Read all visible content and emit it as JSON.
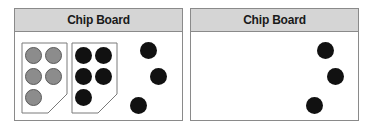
{
  "panels": [
    {
      "title": "Chip Board",
      "holders": [
        {
          "chip_color": "gray",
          "chip_count": 5
        },
        {
          "chip_color": "black",
          "chip_count": 5
        }
      ],
      "loose_chips": {
        "color": "black",
        "count": 3
      }
    },
    {
      "title": "Chip Board",
      "holders": [],
      "loose_chips": {
        "color": "black",
        "count": 3
      }
    }
  ],
  "colors": {
    "header_bg": "#d5d5d5",
    "border": "#8a8a8a",
    "gray_chip": "#8c8c8c",
    "black_chip": "#111111"
  }
}
